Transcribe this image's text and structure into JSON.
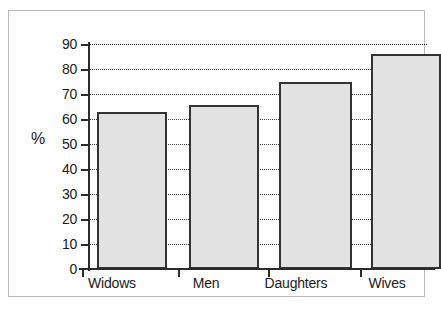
{
  "chart_data": {
    "type": "bar",
    "title": "",
    "subtitle": "",
    "xlabel": "",
    "ylabel": "%",
    "categories": [
      "Widows",
      "Men",
      "Daughters",
      "Wives"
    ],
    "values": [
      63,
      65.5,
      75,
      86
    ],
    "series": [
      {
        "name": "",
        "values": [
          63,
          65.5,
          75,
          86
        ]
      }
    ],
    "ylim": [
      0,
      90
    ],
    "ytick_step": 10,
    "ytick_labels": [
      "0",
      "10",
      "20",
      "30",
      "40",
      "50",
      "60",
      "70",
      "80",
      "90"
    ],
    "grid": "horizontal-dotted",
    "legend": "none",
    "bar_fill_color": "#e2e2e2",
    "bar_border_color": "#333333",
    "axis_color": "#2b2b2b",
    "gridline_color": "#3a3a3a",
    "frame_color": "#b9b9b9",
    "background_color": "#fefefe"
  }
}
